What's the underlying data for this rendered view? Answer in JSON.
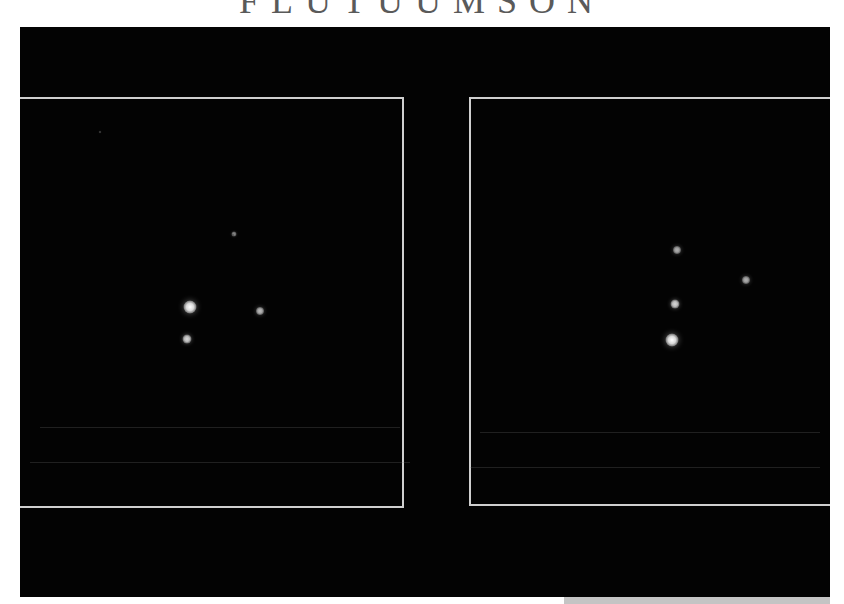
{
  "page": {
    "title_clipped": "FLUTUUMSON"
  },
  "figure": {
    "background_color": "#030303",
    "frame_color": "#cfcfcf",
    "panels": [
      {
        "id": "left",
        "stars": [
          {
            "x": 234,
            "y": 234,
            "size": 5,
            "brightness": 0.55
          },
          {
            "x": 190,
            "y": 307,
            "size": 13,
            "brightness": 1.0
          },
          {
            "x": 260,
            "y": 311,
            "size": 8,
            "brightness": 0.75
          },
          {
            "x": 187,
            "y": 339,
            "size": 9,
            "brightness": 0.85
          },
          {
            "x": 100,
            "y": 132,
            "size": 2,
            "brightness": 0.35
          },
          {
            "x": 233,
            "y": 235,
            "size": 2,
            "brightness": 0.3
          }
        ]
      },
      {
        "id": "right",
        "stars": [
          {
            "x": 677,
            "y": 250,
            "size": 8,
            "brightness": 0.7
          },
          {
            "x": 746,
            "y": 280,
            "size": 8,
            "brightness": 0.7
          },
          {
            "x": 675,
            "y": 304,
            "size": 9,
            "brightness": 0.85
          },
          {
            "x": 672,
            "y": 340,
            "size": 13,
            "brightness": 1.0
          }
        ]
      }
    ]
  }
}
